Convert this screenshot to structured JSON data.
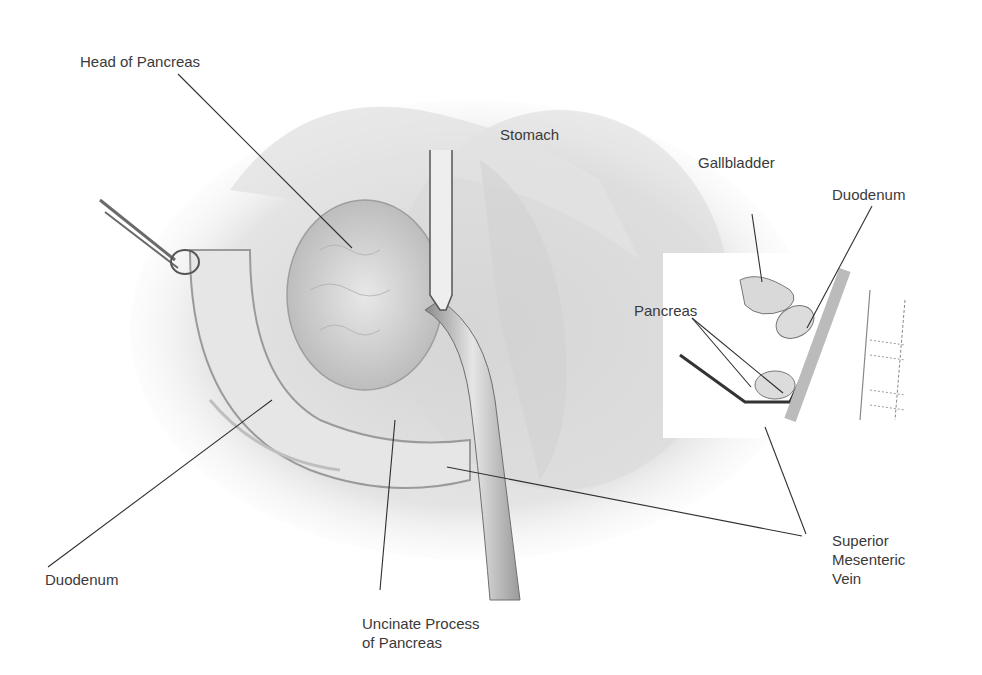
{
  "figure": {
    "type": "surgical anatomical illustration",
    "labels": {
      "head_of_pancreas": "Head of Pancreas",
      "stomach": "Stomach",
      "gallbladder": "Gallbladder",
      "duodenum_inset": "Duodenum",
      "pancreas_inset": "Pancreas",
      "duodenum_main": "Duodenum",
      "uncinate_line1": "Uncinate Process",
      "uncinate_line2": "of Pancreas",
      "smv_line1": "Superior",
      "smv_line2": "Mesenteric",
      "smv_line3": "Vein"
    }
  }
}
